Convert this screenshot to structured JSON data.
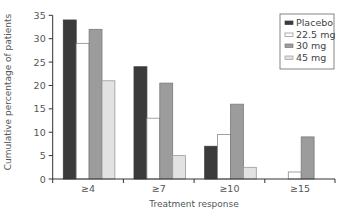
{
  "chart_data": {
    "type": "bar",
    "title": "",
    "xlabel": "Treatment response",
    "ylabel": "Cumulative percentage of patients",
    "ylim": [
      0,
      35
    ],
    "yticks": [
      0,
      5,
      10,
      15,
      20,
      25,
      30,
      35
    ],
    "categories": [
      "≥4",
      "≥7",
      "≥10",
      "≥15"
    ],
    "series": [
      {
        "name": "Placebo",
        "color": "#3b3b3b",
        "stroke": "#3b3b3b",
        "values": [
          34,
          24,
          7,
          0
        ]
      },
      {
        "name": "22.5 mg",
        "color": "#ffffff",
        "stroke": "#8a8a8a",
        "values": [
          29,
          13,
          9.5,
          1.5
        ]
      },
      {
        "name": "30 mg",
        "color": "#9c9c9c",
        "stroke": "#7a7a7a",
        "values": [
          32,
          20.5,
          16,
          9
        ]
      },
      {
        "name": "45 mg",
        "color": "#e2e2e2",
        "stroke": "#9a9a9a",
        "values": [
          21,
          5,
          2.5,
          0
        ]
      }
    ],
    "grid": false,
    "legend_position": "upper right"
  }
}
